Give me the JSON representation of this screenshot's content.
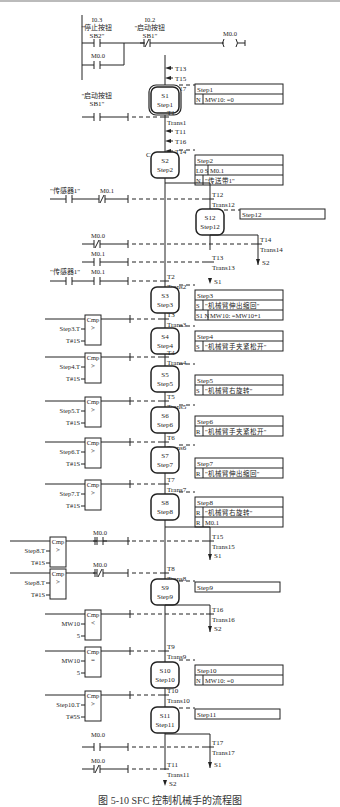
{
  "figure": {
    "caption": "图 5-10  SFC 控制机械手的流程图",
    "colors": {
      "line": "#222222",
      "background": "#ffffff"
    }
  },
  "ladder_top": {
    "contacts": [
      {
        "addr": "I0.3",
        "label": "\"停止按钮",
        "label2": "SB2\"",
        "type": "NO"
      },
      {
        "addr": "I0.2",
        "label": "\"启动按钮",
        "label2": "SB1\"",
        "type": "NC"
      },
      {
        "addr": "M0.0",
        "type": "NO",
        "parallel": true
      }
    ],
    "coil": {
      "addr": "M0.0"
    }
  },
  "jumps_into_s1": [
    "T13",
    "T15",
    "T17"
  ],
  "jumps_into_s2": [
    "T11",
    "T16",
    "T14"
  ],
  "steps": [
    {
      "id": "S1",
      "name": "Step1",
      "initial": true,
      "actions_title": "Step1",
      "actions": [
        {
          "q": "N",
          "a": "MW10: =0"
        }
      ]
    },
    {
      "id": "S2",
      "name": "Step2",
      "marker": "C",
      "actions_title": "Step2",
      "actions": [
        {
          "q": "L0 S",
          "a": "M0.1"
        },
        {
          "q": "N",
          "a": "\"传送带1\""
        }
      ]
    },
    {
      "id": "S12",
      "name": "Step12",
      "actions_title": "Step12",
      "actions": []
    },
    {
      "id": "S3",
      "name": "Step3",
      "actions_title": "Step3",
      "actions": [
        {
          "q": "S",
          "a": "\"机械臂伸出缩回\""
        },
        {
          "q": "S1 N",
          "a": "MW10: =MW10+1"
        }
      ]
    },
    {
      "id": "S4",
      "name": "Step4",
      "actions_title": "Step4",
      "actions": [
        {
          "q": "S",
          "a": "\"机械臂手夹紧松开\""
        }
      ]
    },
    {
      "id": "S5",
      "name": "Step5",
      "actions_title": "Step5",
      "actions": [
        {
          "q": "S",
          "a": "\"机械臂右旋转\""
        }
      ]
    },
    {
      "id": "S6",
      "name": "Step6",
      "actions_title": "Step6",
      "actions": [
        {
          "q": "R",
          "a": "\"机械臂手夹紧松开\""
        }
      ]
    },
    {
      "id": "S7",
      "name": "Step7",
      "actions_title": "Step7",
      "actions": [
        {
          "q": "R",
          "a": "\"机械臂伸出缩回\""
        }
      ]
    },
    {
      "id": "S8",
      "name": "Step8",
      "actions_title": "Step8",
      "actions": [
        {
          "q": "R",
          "a": "\"机械臂右旋转\""
        },
        {
          "q": "R",
          "a": "M0.1"
        }
      ]
    },
    {
      "id": "S9",
      "name": "Step9",
      "actions_title": "Step9",
      "actions": []
    },
    {
      "id": "S10",
      "name": "Step10",
      "actions_title": "Step10",
      "actions": [
        {
          "q": "N",
          "a": "MW10: =0"
        }
      ]
    },
    {
      "id": "S11",
      "name": "Step11",
      "actions_title": "Step11",
      "actions": []
    }
  ],
  "transitions": [
    {
      "id": "T1",
      "name": "Trans1",
      "cond": [
        "\"启动按钮",
        "SB1\""
      ]
    },
    {
      "id": "T12",
      "name": "Trans12",
      "cond": [
        "\"传感器1\"",
        "M0.1 NC"
      ]
    },
    {
      "id": "T14",
      "name": "Trans14",
      "cond": [
        "M0.0 NC"
      ],
      "jump": "S2"
    },
    {
      "id": "T13",
      "name": "Trans13",
      "cond": [
        "M0.1 NO"
      ],
      "jump": "S1"
    },
    {
      "id": "T2",
      "name": "Trans2",
      "cond": [
        "\"传感器1\"",
        "M0.1 NO"
      ]
    },
    {
      "id": "T3",
      "name": "Trans3",
      "cmp": {
        "op": ">",
        "in1": "Step3.T",
        "in2": "T#1S"
      }
    },
    {
      "id": "T4",
      "name": "Trans4",
      "cmp": {
        "op": ">",
        "in1": "Step4.T",
        "in2": "T#1S"
      }
    },
    {
      "id": "T5",
      "name": "Trans5",
      "cmp": {
        "op": ">",
        "in1": "Step5.T",
        "in2": "T#1S"
      }
    },
    {
      "id": "T6",
      "name": "Trans6",
      "cmp": {
        "op": ">",
        "in1": "Step6.T",
        "in2": "T#1S"
      }
    },
    {
      "id": "T7",
      "name": "Trans7",
      "cmp": {
        "op": ">",
        "in1": "Step7.T",
        "in2": "T#1S"
      }
    },
    {
      "id": "T15",
      "name": "Trans15",
      "cmp": {
        "op": ">",
        "in1": "Step8.T",
        "in2": "T#1S"
      },
      "cond": [
        "M0.0 NO"
      ],
      "jump": "S1"
    },
    {
      "id": "T8",
      "name": "Trans8",
      "cmp": {
        "op": ">",
        "in1": "Step8.T",
        "in2": "T#1S"
      },
      "cond": [
        "M0.0 NC"
      ]
    },
    {
      "id": "T16",
      "name": "Trans16",
      "cmp": {
        "op": "<",
        "in1": "MW10",
        "in2": "5"
      },
      "jump": "S2"
    },
    {
      "id": "T9",
      "name": "Trans9",
      "cmp": {
        "op": "==",
        "in1": "MW10",
        "in2": "5"
      }
    },
    {
      "id": "T10",
      "name": "Trans10",
      "cmp": {
        "op": ">",
        "in1": "Step10.T",
        "in2": "T#5S"
      }
    },
    {
      "id": "T17",
      "name": "Trans17",
      "cond": [
        "M0.0 NO"
      ],
      "jump": "S1"
    },
    {
      "id": "T11",
      "name": "Trans11",
      "cond": [
        "M0.0 NC"
      ],
      "jump": "S2"
    }
  ],
  "labels": {
    "cmp": "Cmp",
    "m00": "M0.0",
    "m01": "M0.1",
    "sensor1": "\"传感器1\"",
    "start1": "\"启动按钮",
    "start2": "SB1\"",
    "stop1": "\"停止按钮",
    "stop2": "SB2\"",
    "i03": "I0.3",
    "i02": "I0.2",
    "c_marker": "C"
  }
}
